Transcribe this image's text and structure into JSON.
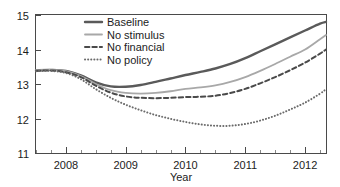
{
  "chart_data": {
    "type": "line",
    "title": "",
    "xlabel": "Year",
    "ylabel": "",
    "xlim": [
      2007.5,
      2012.35
    ],
    "ylim": [
      11,
      15
    ],
    "grid": false,
    "legend_position": "top-center",
    "xticks": [
      "2008",
      "2009",
      "2010",
      "2011",
      "2012"
    ],
    "xtick_values": [
      2008,
      2009,
      2010,
      2011,
      2012
    ],
    "xminor_step": 0.25,
    "yticks": [
      "11",
      "12",
      "13",
      "14",
      "15"
    ],
    "ytick_values": [
      11,
      12,
      13,
      14,
      15
    ],
    "x": [
      2007.5,
      2007.75,
      2008.0,
      2008.25,
      2008.5,
      2008.75,
      2009.0,
      2009.25,
      2009.5,
      2009.75,
      2010.0,
      2010.25,
      2010.5,
      2010.75,
      2011.0,
      2011.25,
      2011.5,
      2011.75,
      2012.0,
      2012.25,
      2012.35
    ],
    "series": [
      {
        "name": "Baseline",
        "style": "solid",
        "color": "#5a5a5a",
        "width": 2.4,
        "values": [
          13.4,
          13.41,
          13.38,
          13.25,
          13.05,
          12.93,
          12.92,
          12.97,
          13.06,
          13.16,
          13.26,
          13.35,
          13.45,
          13.58,
          13.75,
          13.95,
          14.15,
          14.35,
          14.55,
          14.75,
          14.8
        ]
      },
      {
        "name": "No stimulus",
        "style": "solid",
        "color": "#a8a8a8",
        "width": 1.8,
        "values": [
          13.4,
          13.41,
          13.37,
          13.23,
          13.0,
          12.82,
          12.74,
          12.72,
          12.74,
          12.79,
          12.86,
          12.9,
          12.96,
          13.06,
          13.2,
          13.38,
          13.58,
          13.79,
          14.0,
          14.3,
          14.42
        ]
      },
      {
        "name": "No financial",
        "style": "dashed",
        "color": "#4a4a4a",
        "width": 2.0,
        "values": [
          13.38,
          13.39,
          13.34,
          13.2,
          12.95,
          12.75,
          12.64,
          12.6,
          12.59,
          12.6,
          12.62,
          12.63,
          12.66,
          12.74,
          12.86,
          13.02,
          13.2,
          13.4,
          13.62,
          13.88,
          14.0
        ]
      },
      {
        "name": "No policy",
        "style": "dotted",
        "color": "#6a6a6a",
        "width": 2.0,
        "values": [
          13.37,
          13.38,
          13.32,
          13.14,
          12.85,
          12.6,
          12.4,
          12.24,
          12.1,
          11.99,
          11.9,
          11.83,
          11.79,
          11.79,
          11.84,
          11.94,
          12.08,
          12.26,
          12.46,
          12.72,
          12.85
        ]
      }
    ],
    "legend": [
      {
        "label": "Baseline",
        "style": "solid",
        "color": "#5a5a5a"
      },
      {
        "label": "No stimulus",
        "style": "solid",
        "color": "#a8a8a8"
      },
      {
        "label": "No financial",
        "style": "dashed",
        "color": "#4a4a4a"
      },
      {
        "label": "No policy",
        "style": "dotted",
        "color": "#6a6a6a"
      }
    ]
  }
}
